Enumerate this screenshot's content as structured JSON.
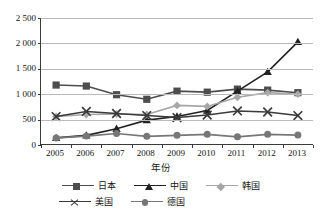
{
  "chart_data": {
    "type": "line",
    "title": "",
    "xlabel": "年份",
    "ylabel": "发明专利族数量",
    "categories": [
      "2005",
      "2006",
      "2007",
      "2008",
      "2009",
      "2010",
      "2011",
      "2012",
      "2013"
    ],
    "ylim": [
      0,
      2500
    ],
    "yticks": [
      0,
      500,
      1000,
      1500,
      2000,
      2500
    ],
    "ytick_labels": [
      "0",
      "500",
      "1 000",
      "1 500",
      "2 000",
      "2 500"
    ],
    "grid": "horizontal",
    "legend_position": "bottom",
    "series": [
      {
        "name": "日本",
        "marker": "square",
        "color": "#4d4d4d",
        "values": [
          1180,
          1160,
          990,
          900,
          1060,
          1040,
          1100,
          1080,
          1030
        ]
      },
      {
        "name": "中国",
        "marker": "triangle",
        "color": "#222222",
        "values": [
          140,
          190,
          320,
          490,
          560,
          680,
          1060,
          1440,
          2030
        ]
      },
      {
        "name": "韩国",
        "marker": "diamond",
        "color": "#a6a6a6",
        "values": [
          560,
          600,
          610,
          600,
          780,
          760,
          940,
          1030,
          1000
        ]
      },
      {
        "name": "美国",
        "marker": "x",
        "color": "#3a3a3a",
        "values": [
          560,
          660,
          620,
          580,
          540,
          590,
          670,
          650,
          580
        ]
      },
      {
        "name": "德国",
        "marker": "circle",
        "color": "#777777",
        "values": [
          140,
          175,
          225,
          170,
          190,
          210,
          160,
          210,
          195
        ]
      }
    ]
  },
  "axis": {
    "y_title": "发明专利族数量",
    "x_title": "年份"
  },
  "colors": {
    "axis": "#3a3a3a",
    "grid": "#b9b9b9",
    "text": "#141414",
    "background": "#ffffff"
  }
}
